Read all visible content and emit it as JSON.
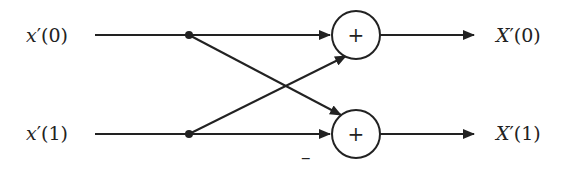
{
  "diagram": {
    "type": "butterfly",
    "inputs": [
      {
        "var": "x",
        "prime": "′",
        "index": "(0)"
      },
      {
        "var": "x",
        "prime": "′",
        "index": "(1)"
      }
    ],
    "outputs": [
      {
        "var": "X",
        "prime": "′",
        "index": "(0)"
      },
      {
        "var": "X",
        "prime": "′",
        "index": "(1)"
      }
    ],
    "adders": [
      {
        "symbol": "+"
      },
      {
        "symbol": "+"
      }
    ],
    "negation_label": "–",
    "stroke_color": "#222222"
  }
}
